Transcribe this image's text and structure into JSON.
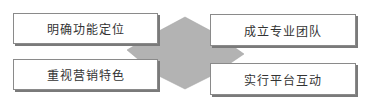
{
  "diagram": {
    "center_shape": {
      "type": "hexagon-arrow",
      "fill": "#b3b3b3"
    },
    "boxes": [
      {
        "id": "top-left",
        "label": "明确功能定位"
      },
      {
        "id": "bottom-left",
        "label": "重视营销特色"
      },
      {
        "id": "top-right",
        "label": "成立专业团队"
      },
      {
        "id": "bottom-right",
        "label": "实行平台互动"
      }
    ]
  }
}
